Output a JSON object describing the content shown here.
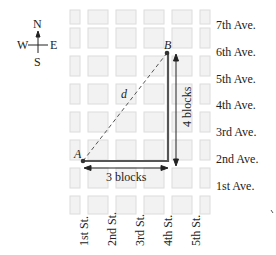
{
  "compass": {
    "north": "N",
    "south": "S",
    "east": "E",
    "west": "W"
  },
  "points": {
    "a": "A",
    "b": "B"
  },
  "labels": {
    "distance": "d",
    "horizontal": "3 blocks",
    "vertical": "4 blocks"
  },
  "avenues": [
    "7th Ave.",
    "6th Ave.",
    "5th Ave.",
    "4th Ave.",
    "3rd Ave.",
    "2nd Ave.",
    "1st Ave."
  ],
  "streets": [
    "1st St.",
    "2nd St.",
    "3rd St.",
    "4th St.",
    "5th St."
  ],
  "colors": {
    "block_fill": "#f1f1f1",
    "block_border": "#d8d8d8",
    "path": "#555555",
    "arrow": "#222222"
  }
}
